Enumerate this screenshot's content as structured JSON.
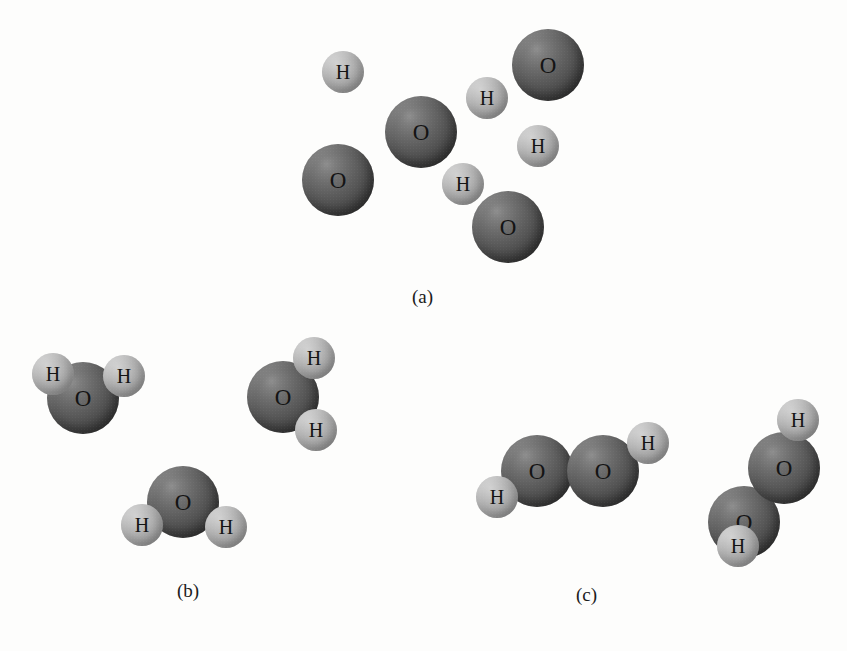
{
  "figure": {
    "width": 847,
    "height": 651,
    "background": "#fdfdfc"
  },
  "style": {
    "oxygen_color": "#4e4e4e",
    "hydrogen_color": "#ababab",
    "label_color": "#141414",
    "oxygen_radius": 36,
    "hydrogen_radius": 21,
    "oxygen_font_size": 23,
    "hydrogen_font_size": 20
  },
  "panels": [
    {
      "id": "panel-a",
      "caption": "(a)",
      "caption_x": 430,
      "caption_y": 298,
      "description": "Separated oxygen and hydrogen atoms",
      "atoms": [
        {
          "element": "H",
          "label": "H",
          "cx": 343,
          "cy": 72,
          "r": 21
        },
        {
          "element": "O",
          "label": "O",
          "cx": 548,
          "cy": 65,
          "r": 36
        },
        {
          "element": "H",
          "label": "H",
          "cx": 487,
          "cy": 98,
          "r": 21
        },
        {
          "element": "O",
          "label": "O",
          "cx": 421,
          "cy": 132,
          "r": 36
        },
        {
          "element": "H",
          "label": "H",
          "cx": 538,
          "cy": 146,
          "r": 21
        },
        {
          "element": "O",
          "label": "O",
          "cx": 338,
          "cy": 180,
          "r": 36
        },
        {
          "element": "H",
          "label": "H",
          "cx": 463,
          "cy": 184,
          "r": 21
        },
        {
          "element": "O",
          "label": "O",
          "cx": 508,
          "cy": 227,
          "r": 36
        }
      ]
    },
    {
      "id": "panel-b",
      "caption": "(b)",
      "caption_x": 195,
      "caption_y": 592,
      "description": "Three water molecules",
      "atoms": [
        {
          "element": "O",
          "label": "O",
          "cx": 83,
          "cy": 398,
          "r": 36
        },
        {
          "element": "H",
          "label": "H",
          "cx": 53,
          "cy": 374,
          "r": 21
        },
        {
          "element": "H",
          "label": "H",
          "cx": 124,
          "cy": 376,
          "r": 21
        },
        {
          "element": "O",
          "label": "O",
          "cx": 283,
          "cy": 397,
          "r": 36
        },
        {
          "element": "H",
          "label": "H",
          "cx": 314,
          "cy": 358,
          "r": 21
        },
        {
          "element": "H",
          "label": "H",
          "cx": 316,
          "cy": 430,
          "r": 21
        },
        {
          "element": "O",
          "label": "O",
          "cx": 183,
          "cy": 502,
          "r": 36
        },
        {
          "element": "H",
          "label": "H",
          "cx": 142,
          "cy": 525,
          "r": 21
        },
        {
          "element": "H",
          "label": "H",
          "cx": 226,
          "cy": 527,
          "r": 21
        }
      ]
    },
    {
      "id": "panel-c",
      "caption": "(c)",
      "caption_x": 594,
      "caption_y": 596,
      "description": "Two hydrogen peroxide molecules",
      "atoms": [
        {
          "element": "H",
          "label": "H",
          "cx": 497,
          "cy": 497,
          "r": 21
        },
        {
          "element": "O",
          "label": "O",
          "cx": 537,
          "cy": 471,
          "r": 36
        },
        {
          "element": "O",
          "label": "O",
          "cx": 603,
          "cy": 471,
          "r": 36
        },
        {
          "element": "H",
          "label": "H",
          "cx": 648,
          "cy": 443,
          "r": 21
        },
        {
          "element": "H",
          "label": "H",
          "cx": 738,
          "cy": 546,
          "r": 21
        },
        {
          "element": "O",
          "label": "O",
          "cx": 744,
          "cy": 522,
          "r": 36
        },
        {
          "element": "O",
          "label": "O",
          "cx": 784,
          "cy": 468,
          "r": 36
        },
        {
          "element": "H",
          "label": "H",
          "cx": 798,
          "cy": 420,
          "r": 21
        }
      ]
    }
  ],
  "chart_data": {
    "type": "diagram",
    "title": "",
    "subtitle": "",
    "panels": [
      {
        "label": "(a)",
        "content": "free atoms",
        "counts": {
          "O": 4,
          "H": 4
        }
      },
      {
        "label": "(b)",
        "content": "water molecules",
        "formula": "H2O",
        "molecules": 3,
        "counts": {
          "O": 3,
          "H": 6
        }
      },
      {
        "label": "(c)",
        "content": "hydrogen peroxide molecules",
        "formula": "H2O2",
        "molecules": 2,
        "counts": {
          "O": 4,
          "H": 4
        }
      }
    ],
    "legend": [
      {
        "symbol": "O",
        "name": "oxygen",
        "color": "#4e4e4e"
      },
      {
        "symbol": "H",
        "name": "hydrogen",
        "color": "#ababab"
      }
    ]
  }
}
